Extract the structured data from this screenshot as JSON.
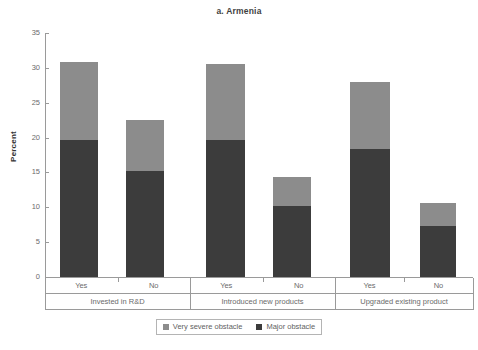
{
  "chart_data": {
    "type": "bar",
    "title": "a. Armenia",
    "subtitle": "",
    "xlabel": "",
    "ylabel": "Percent",
    "ylim": [
      0,
      35
    ],
    "yticks": [
      0,
      5,
      10,
      15,
      20,
      25,
      30,
      35
    ],
    "ytick_labels": [
      "0",
      "5",
      "10",
      "15",
      "20",
      "25",
      "30",
      "35"
    ],
    "grid": false,
    "stacked": true,
    "legend_position": "bottom-center",
    "groups": [
      {
        "label": "Invested in R&D",
        "categories": [
          "Yes",
          "No"
        ]
      },
      {
        "label": "Introduced new products",
        "categories": [
          "Yes",
          "No"
        ]
      },
      {
        "label": "Upgraded existing product",
        "categories": [
          "Yes",
          "No"
        ]
      }
    ],
    "categories": [
      "Invested in R&D - Yes",
      "Invested in R&D - No",
      "Introduced new products - Yes",
      "Introduced new products - No",
      "Upgraded existing product - Yes",
      "Upgraded existing product - No"
    ],
    "series": [
      {
        "name": "Major obstacle",
        "color": "#3c3c3c",
        "values": [
          19.7,
          15.2,
          19.7,
          10.2,
          18.4,
          7.3
        ]
      },
      {
        "name": "Very severe obstacle",
        "color": "#8c8c8c",
        "values": [
          11.2,
          7.3,
          10.9,
          4.1,
          9.6,
          3.3
        ]
      }
    ],
    "totals": [
      30.9,
      22.5,
      30.6,
      14.3,
      28.0,
      10.6
    ],
    "bars": [
      {
        "group": "Invested in R&D",
        "category": "Yes",
        "major_obstacle": 19.7,
        "very_severe_obstacle": 11.2,
        "total": 30.9
      },
      {
        "group": "Invested in R&D",
        "category": "No",
        "major_obstacle": 15.2,
        "very_severe_obstacle": 7.3,
        "total": 22.5
      },
      {
        "group": "Introduced new products",
        "category": "Yes",
        "major_obstacle": 19.7,
        "very_severe_obstacle": 10.9,
        "total": 30.6
      },
      {
        "group": "Introduced new products",
        "category": "No",
        "major_obstacle": 10.2,
        "very_severe_obstacle": 4.1,
        "total": 14.3
      },
      {
        "group": "Upgraded existing product",
        "category": "Yes",
        "major_obstacle": 18.4,
        "very_severe_obstacle": 9.6,
        "total": 28.0
      },
      {
        "group": "Upgraded existing product",
        "category": "No",
        "major_obstacle": 7.3,
        "very_severe_obstacle": 3.3,
        "total": 10.6
      }
    ],
    "legend": [
      {
        "label": "Very severe obstacle",
        "color": "#8c8c8c"
      },
      {
        "label": "Major obstacle",
        "color": "#3c3c3c"
      }
    ]
  },
  "colors": {
    "very_severe_obstacle": "#8c8c8c",
    "major_obstacle": "#3c3c3c",
    "axis": "#9a9a9a",
    "text": "#6b6b6b",
    "title": "#3f3f3f",
    "background": "#ffffff"
  }
}
